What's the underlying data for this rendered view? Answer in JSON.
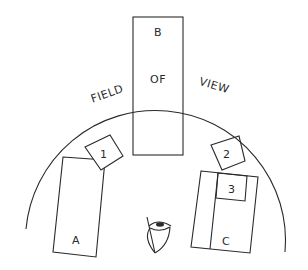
{
  "diagram": {
    "arc_label": {
      "word1": "FIELD",
      "word2": "OF",
      "word3": "VIEW"
    },
    "objects": {
      "A": "A",
      "B": "B",
      "C": "C",
      "one": "1",
      "two": "2",
      "three": "3"
    },
    "observer": "eye-icon",
    "colors": {
      "stroke": "#2a2a2a",
      "background": "#ffffff"
    }
  }
}
